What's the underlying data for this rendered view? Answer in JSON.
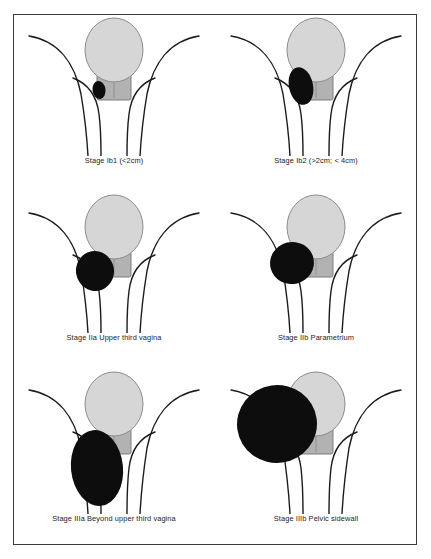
{
  "figure": {
    "border_color": "#3a3a3a",
    "background_color": "#ffffff"
  },
  "palette": {
    "uterus_fill": "#d6d6d6",
    "uterus_stroke": "#8c8c8c",
    "cervix_fill": "#b2b2b2",
    "cervix_stroke": "#7d7d7d",
    "tumor_fill": "#0d0d0d",
    "anatomy_line": "#1b1b1b",
    "caption_color": "#1b1b1b"
  },
  "panels": [
    {
      "id": "stage-ib1",
      "caption": "Stage Ib1 (<2cm)",
      "stage_code": "Ib1",
      "tumor_description": "Small tumor confined to cervix, less than 2 cm",
      "tumor_size_label": "<2cm",
      "anatomy": {
        "uterus": "uterus-body",
        "cervix": "cervix-canal",
        "tumor": "tumor-mass",
        "pelvic_sidewalls": "pelvic-sidewall-curves",
        "vaginal_walls": "vaginal-wall-curves"
      }
    },
    {
      "id": "stage-ib2",
      "caption": "Stage Ib2 (>2cm; < 4cm)",
      "stage_code": "Ib2",
      "tumor_description": "Tumor confined to cervix, greater than 2 cm and less than 4 cm",
      "tumor_size_label": ">2cm; < 4cm",
      "anatomy": {
        "uterus": "uterus-body",
        "cervix": "cervix-canal",
        "tumor": "tumor-mass",
        "pelvic_sidewalls": "pelvic-sidewall-curves",
        "vaginal_walls": "vaginal-wall-curves"
      }
    },
    {
      "id": "stage-iia",
      "caption": "Stage IIa Upper third vagina",
      "stage_code": "IIa",
      "tumor_description": "Tumor extends to upper third of vagina",
      "tumor_size_label": "Upper third vagina",
      "anatomy": {
        "uterus": "uterus-body",
        "cervix": "cervix-canal",
        "tumor": "tumor-mass",
        "pelvic_sidewalls": "pelvic-sidewall-curves",
        "vaginal_walls": "vaginal-wall-curves"
      }
    },
    {
      "id": "stage-iib",
      "caption": "Stage IIb Parametrium",
      "stage_code": "IIb",
      "tumor_description": "Tumor extends into the parametrium",
      "tumor_size_label": "Parametrium",
      "anatomy": {
        "uterus": "uterus-body",
        "cervix": "cervix-canal",
        "tumor": "tumor-mass",
        "pelvic_sidewalls": "pelvic-sidewall-curves",
        "vaginal_walls": "vaginal-wall-curves"
      }
    },
    {
      "id": "stage-iiia",
      "caption": "Stage IIIa Beyond upper third vagina",
      "stage_code": "IIIa",
      "tumor_description": "Tumor extends beyond the upper third of the vagina",
      "tumor_size_label": "Beyond upper third vagina",
      "anatomy": {
        "uterus": "uterus-body",
        "cervix": "cervix-canal",
        "tumor": "tumor-mass",
        "pelvic_sidewalls": "pelvic-sidewall-curves",
        "vaginal_walls": "vaginal-wall-curves"
      }
    },
    {
      "id": "stage-iiib",
      "caption": "Stage IIIb Pelvic sidewall",
      "stage_code": "IIIb",
      "tumor_description": "Tumor extends to the pelvic sidewall",
      "tumor_size_label": "Pelvic sidewall",
      "anatomy": {
        "uterus": "uterus-body",
        "cervix": "cervix-canal",
        "tumor": "tumor-mass",
        "pelvic_sidewalls": "pelvic-sidewall-curves",
        "vaginal_walls": "vaginal-wall-curves"
      }
    }
  ]
}
